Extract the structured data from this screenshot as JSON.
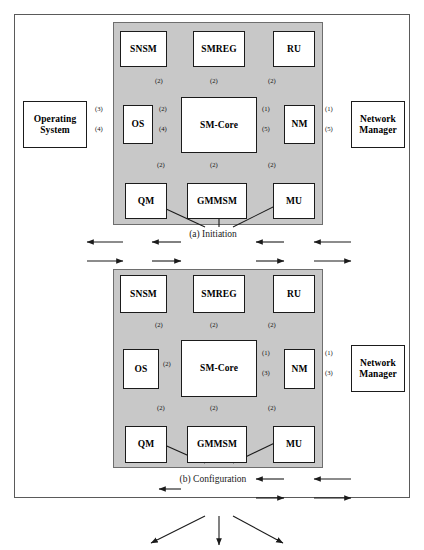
{
  "figure": {
    "background_color": "#ffffff",
    "panel_color": "#c8c8c8",
    "node_color": "#ffffff",
    "line_color": "#1b1b1b"
  },
  "diagrams": [
    {
      "id": "initiation",
      "caption": "(a) Initiation",
      "nodes": [
        {
          "key": "snsm",
          "label": "SNSM",
          "inside_panel": true
        },
        {
          "key": "smreg",
          "label": "SMREG",
          "inside_panel": true
        },
        {
          "key": "ru",
          "label": "RU",
          "inside_panel": true
        },
        {
          "key": "os",
          "label": "OS",
          "inside_panel": true
        },
        {
          "key": "smcore",
          "label": "SM-Core",
          "inside_panel": true
        },
        {
          "key": "nm",
          "label": "NM",
          "inside_panel": true
        },
        {
          "key": "qm",
          "label": "QM",
          "inside_panel": true
        },
        {
          "key": "gmmsm",
          "label": "GMMSM",
          "inside_panel": true
        },
        {
          "key": "mu",
          "label": "MU",
          "inside_panel": true
        },
        {
          "key": "opsys",
          "label_line1": "Operating",
          "label_line2": "System",
          "inside_panel": false
        },
        {
          "key": "netmgr",
          "label_line1": "Network",
          "label_line2": "Manager",
          "inside_panel": false
        }
      ],
      "edges": [
        {
          "from": "smcore",
          "to": "snsm",
          "label": "(2)"
        },
        {
          "from": "smcore",
          "to": "smreg",
          "label": "(2)"
        },
        {
          "from": "smcore",
          "to": "ru",
          "label": "(2)"
        },
        {
          "from": "smcore",
          "to": "qm",
          "label": "(2)"
        },
        {
          "from": "smcore",
          "to": "gmmsm",
          "label": "(2)"
        },
        {
          "from": "smcore",
          "to": "mu",
          "label": "(2)"
        },
        {
          "from": "smcore",
          "to": "os",
          "label": "(2)"
        },
        {
          "from": "os",
          "to": "smcore",
          "label": "(4)"
        },
        {
          "from": "os",
          "to": "opsys",
          "label": "(3)"
        },
        {
          "from": "opsys",
          "to": "os",
          "label": "(4)"
        },
        {
          "from": "nm",
          "to": "smcore",
          "label": "(1)"
        },
        {
          "from": "smcore",
          "to": "nm",
          "label": "(5)"
        },
        {
          "from": "netmgr",
          "to": "nm",
          "label": "(1)"
        },
        {
          "from": "nm",
          "to": "netmgr",
          "label": "(5)"
        }
      ]
    },
    {
      "id": "configuration",
      "caption": "(b) Configuration",
      "nodes": [
        {
          "key": "snsm",
          "label": "SNSM",
          "inside_panel": true
        },
        {
          "key": "smreg",
          "label": "SMREG",
          "inside_panel": true
        },
        {
          "key": "ru",
          "label": "RU",
          "inside_panel": true
        },
        {
          "key": "os",
          "label": "OS",
          "inside_panel": true
        },
        {
          "key": "smcore",
          "label": "SM-Core",
          "inside_panel": true
        },
        {
          "key": "nm",
          "label": "NM",
          "inside_panel": true
        },
        {
          "key": "qm",
          "label": "QM",
          "inside_panel": true
        },
        {
          "key": "gmmsm",
          "label": "GMMSM",
          "inside_panel": true
        },
        {
          "key": "mu",
          "label": "MU",
          "inside_panel": true
        },
        {
          "key": "netmgr",
          "label_line1": "Network",
          "label_line2": "Manager",
          "inside_panel": false
        }
      ],
      "edges": [
        {
          "from": "smcore",
          "to": "snsm",
          "label": "(2)"
        },
        {
          "from": "smcore",
          "to": "smreg",
          "label": "(2)"
        },
        {
          "from": "smcore",
          "to": "ru",
          "label": "(2)"
        },
        {
          "from": "smcore",
          "to": "qm",
          "label": "(2)"
        },
        {
          "from": "smcore",
          "to": "gmmsm",
          "label": "(2)"
        },
        {
          "from": "smcore",
          "to": "mu",
          "label": "(2)"
        },
        {
          "from": "smcore",
          "to": "os",
          "label": "(2)"
        },
        {
          "from": "nm",
          "to": "smcore",
          "label": "(1)"
        },
        {
          "from": "smcore",
          "to": "nm",
          "label": "(3)"
        },
        {
          "from": "netmgr",
          "to": "nm",
          "label": "(1)"
        },
        {
          "from": "nm",
          "to": "netmgr",
          "label": "(3)"
        }
      ]
    }
  ],
  "labels": {
    "a": {
      "snsm": "SNSM",
      "smreg": "SMREG",
      "ru": "RU",
      "os": "OS",
      "smcore": "SM-Core",
      "nm": "NM",
      "qm": "QM",
      "gmmsm": "GMMSM",
      "mu": "MU",
      "opsys_l1": "Operating",
      "opsys_l2": "System",
      "netmgr_l1": "Network",
      "netmgr_l2": "Manager",
      "caption": "(a) Initiation",
      "e_snsm": "(2)",
      "e_smreg": "(2)",
      "e_ru": "(2)",
      "e_qm": "(2)",
      "e_gmmsm": "(2)",
      "e_mu": "(2)",
      "e_core_os": "(2)",
      "e_os_core": "(4)",
      "e_os_opsys": "(3)",
      "e_opsys_os": "(4)",
      "e_nm_core": "(1)",
      "e_core_nm": "(5)",
      "e_netmgr_nm": "(1)",
      "e_nm_netmgr": "(5)"
    },
    "b": {
      "snsm": "SNSM",
      "smreg": "SMREG",
      "ru": "RU",
      "os": "OS",
      "smcore": "SM-Core",
      "nm": "NM",
      "qm": "QM",
      "gmmsm": "GMMSM",
      "mu": "MU",
      "netmgr_l1": "Network",
      "netmgr_l2": "Manager",
      "caption": "(b) Configuration",
      "e_snsm": "(2)",
      "e_smreg": "(2)",
      "e_ru": "(2)",
      "e_qm": "(2)",
      "e_gmmsm": "(2)",
      "e_mu": "(2)",
      "e_core_os": "(2)",
      "e_nm_core": "(1)",
      "e_core_nm": "(3)",
      "e_netmgr_nm": "(1)",
      "e_nm_netmgr": "(3)"
    }
  }
}
